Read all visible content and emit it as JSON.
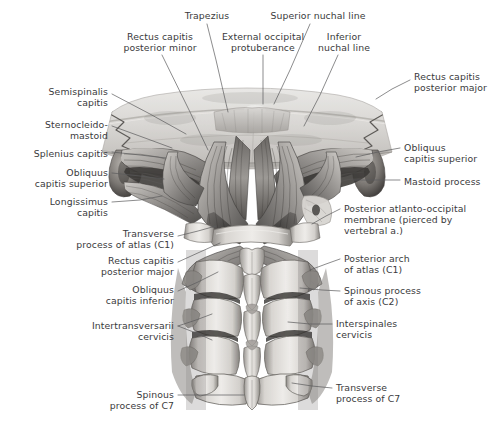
{
  "figure": {
    "kind": "anatomical-illustration",
    "background_color": "#ffffff",
    "label_color": "#3a3a3c",
    "leader_color": "#5a5a5c"
  },
  "labels": [
    {
      "id": "trapezius",
      "text": "Trapezius",
      "align": "center",
      "x": 176,
      "y": 10,
      "w": 62,
      "leader": [
        [
          207,
          24
        ],
        [
          216,
          60
        ],
        [
          228,
          112
        ]
      ]
    },
    {
      "id": "rectus-post-minor",
      "text": "Rectus capitis\nposterior minor",
      "align": "center",
      "x": 112,
      "y": 31,
      "w": 96,
      "leader": [
        [
          162,
          55
        ],
        [
          190,
          112
        ],
        [
          208,
          150
        ]
      ]
    },
    {
      "id": "external-occ-prot",
      "text": "External occipital\nprotuberance",
      "align": "center",
      "x": 213,
      "y": 31,
      "w": 100,
      "leader": [
        [
          263,
          55
        ],
        [
          263,
          80
        ],
        [
          263,
          104
        ]
      ]
    },
    {
      "id": "superior-nuchal-line",
      "text": "Superior nuchal line",
      "align": "center",
      "x": 262,
      "y": 10,
      "w": 112,
      "leader": [
        [
          310,
          24
        ],
        [
          290,
          70
        ],
        [
          274,
          104
        ]
      ]
    },
    {
      "id": "inferior-nuchal-line",
      "text": "Inferior\nnuchal line",
      "align": "center",
      "x": 312,
      "y": 31,
      "w": 64,
      "leader": [
        [
          338,
          55
        ],
        [
          320,
          95
        ],
        [
          304,
          126
        ]
      ]
    },
    {
      "id": "rectus-post-major-r",
      "text": "Rectus capitis\nposterior major",
      "align": "left",
      "x": 414,
      "y": 71,
      "w": 78,
      "leader": [
        [
          410,
          80
        ],
        [
          392,
          89
        ],
        [
          376,
          99
        ]
      ]
    },
    {
      "id": "semispinalis-capitis",
      "text": "Semispinalis\ncapitis",
      "align": "right",
      "x": 18,
      "y": 86,
      "w": 90,
      "leader": [
        [
          112,
          94
        ],
        [
          150,
          114
        ],
        [
          186,
          134
        ]
      ]
    },
    {
      "id": "sternocleidomastoid",
      "text": "Sternocleido-\nmastoid",
      "align": "right",
      "x": 18,
      "y": 119,
      "w": 90,
      "leader": [
        [
          112,
          126
        ],
        [
          145,
          138
        ],
        [
          172,
          148
        ]
      ]
    },
    {
      "id": "splenius-capitis",
      "text": "Splenius capitis",
      "align": "right",
      "x": 10,
      "y": 148,
      "w": 98,
      "leader": [
        [
          112,
          152
        ],
        [
          140,
          155
        ],
        [
          166,
          158
        ]
      ]
    },
    {
      "id": "obliquus-cap-sup-l",
      "text": "Obliquus\ncapitis superior",
      "align": "right",
      "x": 14,
      "y": 167,
      "w": 94,
      "leader": [
        [
          112,
          173
        ],
        [
          140,
          176
        ],
        [
          164,
          179
        ]
      ]
    },
    {
      "id": "longissimus-capitis",
      "text": "Longissimus\ncapitis",
      "align": "right",
      "x": 18,
      "y": 196,
      "w": 90,
      "leader": [
        [
          112,
          202
        ],
        [
          140,
          200
        ],
        [
          162,
          196
        ]
      ]
    },
    {
      "id": "obliquus-cap-sup-r",
      "text": "Obliquus\ncapitis superior",
      "align": "left",
      "x": 404,
      "y": 142,
      "w": 88,
      "leader": [
        [
          400,
          148
        ],
        [
          378,
          152
        ],
        [
          356,
          157
        ]
      ]
    },
    {
      "id": "mastoid-process",
      "text": "Mastoid process",
      "align": "left",
      "x": 404,
      "y": 176,
      "w": 88,
      "leader": [
        [
          400,
          180
        ],
        [
          378,
          180
        ],
        [
          354,
          180
        ]
      ]
    },
    {
      "id": "posterior-ao-membrane",
      "text": "Posterior atlanto-occipital\nmembrane (pierced by\nvertebral a.)",
      "align": "left",
      "x": 344,
      "y": 203,
      "w": 146,
      "leader": [
        [
          340,
          209
        ],
        [
          326,
          216
        ],
        [
          312,
          224
        ]
      ]
    },
    {
      "id": "posterior-arch-atlas",
      "text": "Posterior arch\nof atlas (C1)",
      "align": "left",
      "x": 344,
      "y": 253,
      "w": 90,
      "leader": [
        [
          340,
          259
        ],
        [
          326,
          264
        ],
        [
          310,
          270
        ]
      ]
    },
    {
      "id": "spinous-process-axis",
      "text": "Spinous process\nof axis (C2)",
      "align": "left",
      "x": 344,
      "y": 285,
      "w": 96,
      "leader": [
        [
          340,
          291
        ],
        [
          322,
          290
        ],
        [
          300,
          288
        ]
      ]
    },
    {
      "id": "transverse-atlas",
      "text": "Transverse\nprocess of atlas (C1)",
      "align": "right",
      "x": 28,
      "y": 228,
      "w": 146,
      "leader": [
        [
          178,
          236
        ],
        [
          198,
          231
        ],
        [
          216,
          226
        ]
      ]
    },
    {
      "id": "rectus-post-major-l",
      "text": "Rectus capitis\nposterior major",
      "align": "right",
      "x": 60,
      "y": 255,
      "w": 114,
      "leader": [
        [
          178,
          262
        ],
        [
          200,
          252
        ],
        [
          220,
          243
        ]
      ]
    },
    {
      "id": "obliquus-cap-inf",
      "text": "Obliquus\ncapitis inferior",
      "align": "right",
      "x": 64,
      "y": 284,
      "w": 110,
      "leader": [
        [
          178,
          291
        ],
        [
          198,
          282
        ],
        [
          218,
          272
        ]
      ]
    },
    {
      "id": "interspinales",
      "text": "Interspinales\ncervicis",
      "align": "left",
      "x": 336,
      "y": 318,
      "w": 84,
      "leader": [
        [
          332,
          324
        ],
        [
          310,
          324
        ],
        [
          288,
          322
        ]
      ]
    },
    {
      "id": "intertransversarii",
      "text": "Intertransversarii\ncervicis",
      "align": "right",
      "x": 60,
      "y": 320,
      "w": 114,
      "leader": [
        [
          178,
          326
        ],
        [
          196,
          320
        ],
        [
          212,
          314
        ]
      ]
    },
    {
      "id": "intertransversarii-2",
      "text": "",
      "align": "right",
      "x": 0,
      "y": 0,
      "w": 0,
      "leader": [
        [
          178,
          326
        ],
        [
          196,
          333
        ],
        [
          212,
          340
        ]
      ]
    },
    {
      "id": "spinous-process-c7",
      "text": "Spinous\nprocess of C7",
      "align": "right",
      "x": 80,
      "y": 389,
      "w": 94,
      "leader": [
        [
          178,
          395
        ],
        [
          212,
          395
        ],
        [
          244,
          395
        ]
      ]
    },
    {
      "id": "transverse-process-c7",
      "text": "Transverse\nprocess of C7",
      "align": "left",
      "x": 336,
      "y": 382,
      "w": 96,
      "leader": [
        [
          332,
          388
        ],
        [
          312,
          386
        ],
        [
          292,
          383
        ]
      ]
    }
  ]
}
